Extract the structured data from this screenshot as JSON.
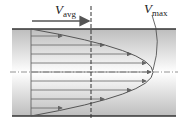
{
  "diagram": {
    "labels": {
      "v_avg_main": "V",
      "v_avg_sub": "avg",
      "v_max_main": "V",
      "v_max_sub": "max"
    },
    "geometry": {
      "pipe_left": 12,
      "pipe_right": 176,
      "wall_top": 29,
      "wall_bottom": 116,
      "centerline": 72,
      "profile_base_x": 31,
      "avg_line_x": 91,
      "max_tip_x": 153
    },
    "arrow_rows_y": [
      38,
      48,
      57,
      66,
      72,
      78,
      87,
      96,
      106
    ],
    "colors": {
      "wall": "#333333",
      "profile": "#555555",
      "arrow": "#666666",
      "gradient_edge": "#c8c8c8",
      "gradient_center": "#ffffff"
    }
  }
}
